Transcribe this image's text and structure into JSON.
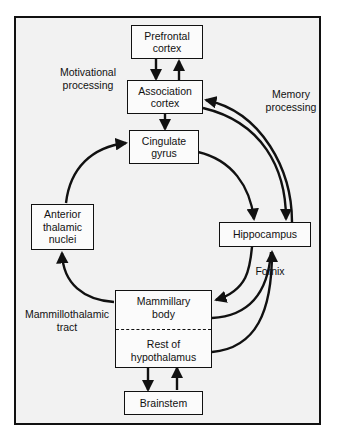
{
  "figure": {
    "border_color": "#111111",
    "panel_background": "#f2f2f2",
    "node_fill": "#fbfbfb"
  },
  "nodes": [
    {
      "id": "prefrontal_cortex",
      "line1": "Prefrontal",
      "line2": "cortex"
    },
    {
      "id": "association_cortex",
      "line1": "Association",
      "line2": "cortex"
    },
    {
      "id": "cingulate_gyrus",
      "line1": "Cingulate",
      "line2": "gyrus"
    },
    {
      "id": "anterior_thalamic_nuclei",
      "line1": "Anterior",
      "line2": "thalamic",
      "line3": "nuclei"
    },
    {
      "id": "hippocampus",
      "line1": "Hippocampus",
      "line2": ""
    },
    {
      "id": "mammillary_body",
      "line1": "Mammillary",
      "line2": "body"
    },
    {
      "id": "rest_of_hypothalamus",
      "line1": "Rest of",
      "line2": "hypothalamus"
    },
    {
      "id": "brainstem",
      "line1": "Brainstem",
      "line2": ""
    }
  ],
  "labels": [
    {
      "id": "motivational_processing",
      "line1": "Motivational",
      "line2": "processing"
    },
    {
      "id": "memory_processing",
      "line1": "Memory",
      "line2": "processing"
    },
    {
      "id": "mammillothalamic_tract",
      "line1": "Mammillothalamic",
      "line2": "tract"
    },
    {
      "id": "fornix",
      "line1": "Fornix",
      "line2": ""
    }
  ],
  "connections": [
    {
      "from": "association_cortex",
      "to": "prefrontal_cortex",
      "style": "straight-arrow-up"
    },
    {
      "from": "prefrontal_cortex",
      "to": "association_cortex",
      "style": "straight-arrow-down"
    },
    {
      "from": "association_cortex",
      "to": "cingulate_gyrus",
      "style": "straight-arrow-down"
    },
    {
      "from": "cingulate_gyrus",
      "to": "hippocampus",
      "style": "curved-arrow"
    },
    {
      "from": "hippocampus",
      "to": "association_cortex",
      "style": "curved-arrow"
    },
    {
      "from": "association_cortex",
      "to": "hippocampus",
      "style": "curved-arrow"
    },
    {
      "from": "anterior_thalamic_nuclei",
      "to": "cingulate_gyrus",
      "style": "curved-arrow"
    },
    {
      "from": "mammillary_body",
      "to": "anterior_thalamic_nuclei",
      "style": "curved-arrow",
      "label": "mammillothalamic_tract"
    },
    {
      "from": "hippocampus",
      "to": "mammillary_body",
      "style": "curved-arrow",
      "label": "fornix"
    },
    {
      "from": "rest_of_hypothalamus",
      "to": "hippocampus",
      "style": "curved-arrow",
      "label": "fornix"
    },
    {
      "from": "mammillary_body",
      "to": "rest_of_hypothalamus",
      "style": "straight-arrow-down"
    },
    {
      "from": "rest_of_hypothalamus",
      "to": "mammillary_body",
      "style": "straight-arrow-up"
    },
    {
      "from": "rest_of_hypothalamus",
      "to": "brainstem",
      "style": "straight-arrow-down"
    },
    {
      "from": "brainstem",
      "to": "rest_of_hypothalamus",
      "style": "straight-arrow-up"
    }
  ]
}
